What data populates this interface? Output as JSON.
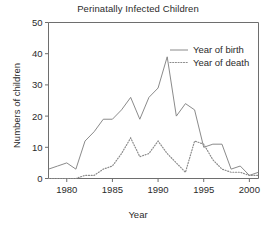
{
  "chart_data": {
    "type": "line",
    "title": "Perinatally Infected Children",
    "xlabel": "Year",
    "ylabel": "Numbers of children",
    "xlim": [
      1978,
      2001
    ],
    "ylim": [
      0,
      50
    ],
    "xticks": [
      1980,
      1985,
      1990,
      1995,
      2000
    ],
    "yticks": [
      0,
      10,
      20,
      30,
      40,
      50
    ],
    "grid": false,
    "legend_position": "top-right",
    "x": [
      1978,
      1979,
      1980,
      1981,
      1982,
      1983,
      1984,
      1985,
      1986,
      1987,
      1988,
      1989,
      1990,
      1991,
      1992,
      1993,
      1994,
      1995,
      1996,
      1997,
      1998,
      1999,
      2000,
      2001
    ],
    "series": [
      {
        "name": "Year of birth",
        "style": "solid",
        "color": "#7d7d7d",
        "values": [
          3,
          4,
          5,
          3,
          12,
          15,
          19,
          19,
          22,
          26,
          19,
          26,
          29,
          39,
          20,
          24,
          22,
          10,
          11,
          11,
          3,
          4,
          1,
          2
        ]
      },
      {
        "name": "Year of death",
        "style": "dotted",
        "color": "#8c8c8c",
        "values": [
          0,
          0,
          0,
          0,
          1,
          1,
          3,
          4,
          8,
          13,
          7,
          8,
          12,
          8,
          5,
          2,
          12,
          11,
          6,
          3,
          2,
          2,
          1,
          1
        ]
      }
    ]
  },
  "legend": {
    "items": [
      {
        "label": "Year of birth"
      },
      {
        "label": "Year of death"
      }
    ]
  }
}
